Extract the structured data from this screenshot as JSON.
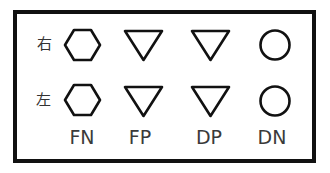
{
  "diagram": {
    "rows": [
      {
        "label": "右",
        "symbols": [
          "hexagon",
          "down-triangle",
          "down-triangle",
          "circle"
        ]
      },
      {
        "label": "左",
        "symbols": [
          "hexagon",
          "down-triangle",
          "down-triangle",
          "circle"
        ]
      }
    ],
    "columns": [
      {
        "label": "FN",
        "symbol": "hexagon"
      },
      {
        "label": "FP",
        "symbol": "down-triangle"
      },
      {
        "label": "DP",
        "symbol": "down-triangle"
      },
      {
        "label": "DN",
        "symbol": "circle"
      }
    ],
    "colors": {
      "stroke": "#111111",
      "text": "#3a3a3a",
      "background": "#ffffff"
    }
  }
}
